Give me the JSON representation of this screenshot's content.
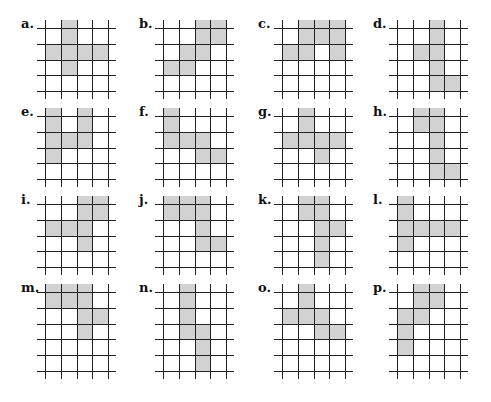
{
  "figure": {
    "cell_size": 15.8,
    "shade_color": "#d2d2d2",
    "line_color": "#222222",
    "columns": 4,
    "puzzles": [
      {
        "label": "a.",
        "x": 45,
        "y": 28,
        "rows": 4,
        "shaded": [
          [
            0,
            1
          ],
          [
            1,
            0
          ],
          [
            1,
            1
          ],
          [
            1,
            2
          ],
          [
            1,
            3
          ],
          [
            2,
            1
          ]
        ]
      },
      {
        "label": "b.",
        "x": 163,
        "y": 28,
        "rows": 4,
        "shaded": [
          [
            0,
            2
          ],
          [
            0,
            3
          ],
          [
            1,
            1
          ],
          [
            1,
            2
          ],
          [
            2,
            0
          ],
          [
            2,
            1
          ]
        ]
      },
      {
        "label": "c.",
        "x": 282,
        "y": 28,
        "rows": 4,
        "shaded": [
          [
            0,
            1
          ],
          [
            0,
            2
          ],
          [
            0,
            3
          ],
          [
            1,
            0
          ],
          [
            1,
            1
          ],
          [
            1,
            3
          ]
        ]
      },
      {
        "label": "d.",
        "x": 397,
        "y": 28,
        "rows": 4,
        "shaded": [
          [
            0,
            2
          ],
          [
            1,
            1
          ],
          [
            1,
            2
          ],
          [
            2,
            2
          ],
          [
            3,
            2
          ],
          [
            3,
            3
          ]
        ]
      },
      {
        "label": "e.",
        "x": 45,
        "y": 116,
        "rows": 4,
        "shaded": [
          [
            0,
            0
          ],
          [
            0,
            2
          ],
          [
            1,
            0
          ],
          [
            1,
            1
          ],
          [
            1,
            2
          ],
          [
            2,
            0
          ]
        ]
      },
      {
        "label": "f.",
        "x": 163,
        "y": 116,
        "rows": 4,
        "shaded": [
          [
            0,
            0
          ],
          [
            1,
            0
          ],
          [
            1,
            1
          ],
          [
            1,
            2
          ],
          [
            2,
            2
          ],
          [
            2,
            3
          ]
        ]
      },
      {
        "label": "g.",
        "x": 282,
        "y": 116,
        "rows": 4,
        "shaded": [
          [
            0,
            1
          ],
          [
            1,
            0
          ],
          [
            1,
            1
          ],
          [
            1,
            2
          ],
          [
            1,
            3
          ],
          [
            2,
            2
          ]
        ]
      },
      {
        "label": "h.",
        "x": 397,
        "y": 116,
        "rows": 4,
        "shaded": [
          [
            0,
            1
          ],
          [
            0,
            2
          ],
          [
            1,
            2
          ],
          [
            2,
            2
          ],
          [
            3,
            2
          ],
          [
            3,
            3
          ]
        ]
      },
      {
        "label": "i.",
        "x": 45,
        "y": 204,
        "rows": 4,
        "shaded": [
          [
            0,
            2
          ],
          [
            0,
            3
          ],
          [
            1,
            0
          ],
          [
            1,
            1
          ],
          [
            1,
            2
          ],
          [
            2,
            2
          ]
        ]
      },
      {
        "label": "j.",
        "x": 163,
        "y": 204,
        "rows": 4,
        "shaded": [
          [
            0,
            0
          ],
          [
            0,
            1
          ],
          [
            0,
            2
          ],
          [
            1,
            2
          ],
          [
            2,
            2
          ],
          [
            2,
            3
          ]
        ]
      },
      {
        "label": "k.",
        "x": 282,
        "y": 204,
        "rows": 4,
        "shaded": [
          [
            0,
            1
          ],
          [
            0,
            2
          ],
          [
            1,
            2
          ],
          [
            1,
            3
          ],
          [
            2,
            2
          ],
          [
            3,
            2
          ]
        ]
      },
      {
        "label": "l.",
        "x": 397,
        "y": 204,
        "rows": 4,
        "shaded": [
          [
            0,
            0
          ],
          [
            1,
            0
          ],
          [
            1,
            1
          ],
          [
            1,
            2
          ],
          [
            1,
            3
          ],
          [
            2,
            0
          ]
        ]
      },
      {
        "label": "m.",
        "x": 45,
        "y": 292,
        "rows": 5,
        "shaded": [
          [
            0,
            0
          ],
          [
            0,
            1
          ],
          [
            0,
            2
          ],
          [
            1,
            2
          ],
          [
            1,
            3
          ],
          [
            2,
            2
          ]
        ]
      },
      {
        "label": "n.",
        "x": 163,
        "y": 292,
        "rows": 5,
        "shaded": [
          [
            0,
            1
          ],
          [
            1,
            1
          ],
          [
            2,
            1
          ],
          [
            2,
            2
          ],
          [
            3,
            2
          ],
          [
            4,
            2
          ]
        ]
      },
      {
        "label": "o.",
        "x": 282,
        "y": 292,
        "rows": 5,
        "shaded": [
          [
            0,
            1
          ],
          [
            1,
            0
          ],
          [
            1,
            1
          ],
          [
            1,
            2
          ],
          [
            2,
            2
          ],
          [
            2,
            3
          ]
        ]
      },
      {
        "label": "p.",
        "x": 397,
        "y": 292,
        "rows": 5,
        "shaded": [
          [
            0,
            1
          ],
          [
            0,
            2
          ],
          [
            1,
            0
          ],
          [
            1,
            1
          ],
          [
            2,
            0
          ],
          [
            3,
            0
          ]
        ]
      }
    ]
  }
}
